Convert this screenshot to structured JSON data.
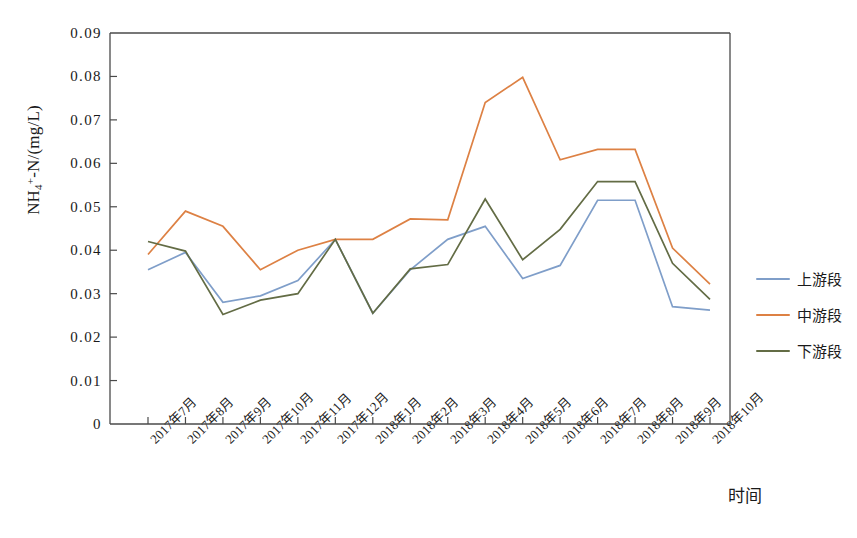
{
  "chart_data": {
    "type": "line",
    "title": "",
    "xlabel": "时间",
    "ylabel": "NH4+-N/(mg/L)",
    "ylabel_parts": {
      "base": "NH",
      "sub": "4",
      "sup": "+",
      "rest": "-N/(mg/L)"
    },
    "ylim": [
      0,
      0.09
    ],
    "ytick_step": 0.01,
    "grid": false,
    "legend_position": "right",
    "categories": [
      "2017年7月",
      "2017年8月",
      "2017年9月",
      "2017年10月",
      "2017年11月",
      "2017年12月",
      "2018年1月",
      "2018年2月",
      "2018年3月",
      "2018年4月",
      "2018年5月",
      "2018年6月",
      "2018年7月",
      "2018年8月",
      "2018年9月",
      "2018年10月"
    ],
    "ytick_labels": [
      "0.09",
      "0.08",
      "0.07",
      "0.06",
      "0.05",
      "0.04",
      "0.03",
      "0.02",
      "0.01",
      "0"
    ],
    "ytick_values": [
      0.09,
      0.08,
      0.07,
      0.06,
      0.05,
      0.04,
      0.03,
      0.02,
      0.01,
      0
    ],
    "series": [
      {
        "name": "上游段",
        "color": "#7f9ec9",
        "values": [
          0.0355,
          0.0395,
          0.028,
          0.0295,
          0.033,
          0.0425,
          0.0255,
          0.0355,
          0.0425,
          0.0455,
          0.0335,
          0.0365,
          0.0515,
          0.0515,
          0.027,
          0.0262
        ]
      },
      {
        "name": "中游段",
        "color": "#dd8144",
        "values": [
          0.039,
          0.049,
          0.0455,
          0.0355,
          0.04,
          0.0425,
          0.0425,
          0.0472,
          0.047,
          0.074,
          0.0798,
          0.0608,
          0.0632,
          0.0632,
          0.0405,
          0.0322
        ]
      },
      {
        "name": "下游段",
        "color": "#636c45",
        "values": [
          0.042,
          0.0398,
          0.0252,
          0.0285,
          0.03,
          0.0425,
          0.0255,
          0.0357,
          0.0367,
          0.0518,
          0.0378,
          0.0448,
          0.0558,
          0.0558,
          0.037,
          0.0287
        ]
      }
    ]
  },
  "legend": {
    "items": [
      {
        "label": "上游段",
        "color": "#7f9ec9"
      },
      {
        "label": "中游段",
        "color": "#dd8144"
      },
      {
        "label": "下游段",
        "color": "#636c45"
      }
    ]
  },
  "axes": {
    "x_axis_label": "时间",
    "y_axis_label": "NH4+-N/(mg/L)"
  }
}
